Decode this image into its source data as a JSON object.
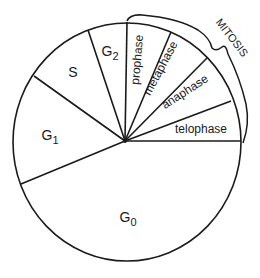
{
  "diagram": {
    "segments": [
      {
        "id": "g0",
        "label": "G",
        "sub": "0"
      },
      {
        "id": "g1",
        "label": "G",
        "sub": "1"
      },
      {
        "id": "s",
        "label": "S"
      },
      {
        "id": "g2",
        "label": "G",
        "sub": "2"
      },
      {
        "id": "prophase",
        "label": "prophase"
      },
      {
        "id": "metaphase",
        "label": "metaphase"
      },
      {
        "id": "anaphase",
        "label": "anaphase"
      },
      {
        "id": "telophase",
        "label": "telophase"
      }
    ],
    "bracket_label": "MITOSIS",
    "colors": {
      "line": "#1a1a1a",
      "background": "#ffffff"
    }
  }
}
